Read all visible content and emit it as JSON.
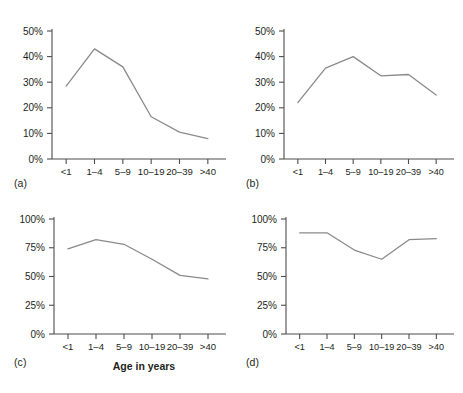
{
  "figure": {
    "panels": [
      {
        "id": "a",
        "label": "(a)",
        "y_ticks": [
          "0%",
          "10%",
          "20%",
          "30%",
          "40%",
          "50%"
        ],
        "x_ticks": [
          "<1",
          "1–4",
          "5–9",
          "10–19",
          "20–39",
          ">40"
        ],
        "line_color": "#8a8a8a"
      },
      {
        "id": "b",
        "label": "(b)",
        "y_ticks": [
          "0%",
          "10%",
          "20%",
          "30%",
          "40%",
          "50%"
        ],
        "x_ticks": [
          "<1",
          "1–4",
          "5–9",
          "10–19",
          "20–39",
          ">40"
        ],
        "line_color": "#8a8a8a"
      },
      {
        "id": "c",
        "label": "(c)",
        "y_ticks": [
          "0%",
          "25%",
          "50%",
          "75%",
          "100%"
        ],
        "x_ticks": [
          "<1",
          "1–4",
          "5–9",
          "10–19",
          "20–39",
          ">40"
        ],
        "axis_title": "Age in years",
        "line_color": "#8a8a8a"
      },
      {
        "id": "d",
        "label": "(d)",
        "y_ticks": [
          "0%",
          "25%",
          "50%",
          "75%",
          "100%"
        ],
        "x_ticks": [
          "<1",
          "1–4",
          "5–9",
          "10–19",
          "20–39",
          ">40"
        ],
        "line_color": "#8a8a8a"
      }
    ]
  },
  "chart_data": [
    {
      "type": "line",
      "panel": "a",
      "title": "(a)",
      "xlabel": "",
      "ylabel": "",
      "categories": [
        "<1",
        "1–4",
        "5–9",
        "10–19",
        "20–39",
        ">40"
      ],
      "values": [
        28.5,
        43.0,
        36.0,
        16.5,
        10.5,
        8.0
      ],
      "ylim": [
        0,
        50
      ],
      "ytick_values": [
        0,
        10,
        20,
        30,
        40,
        50
      ],
      "ytick_labels": [
        "0%",
        "10%",
        "20%",
        "30%",
        "40%",
        "50%"
      ],
      "grid": false,
      "legend": "none",
      "line_color": "#8a8a8a"
    },
    {
      "type": "line",
      "panel": "b",
      "title": "(b)",
      "xlabel": "",
      "ylabel": "",
      "categories": [
        "<1",
        "1–4",
        "5–9",
        "10–19",
        "20–39",
        ">40"
      ],
      "values": [
        22.0,
        35.5,
        40.0,
        32.5,
        33.0,
        25.0
      ],
      "ylim": [
        0,
        50
      ],
      "ytick_values": [
        0,
        10,
        20,
        30,
        40,
        50
      ],
      "ytick_labels": [
        "0%",
        "10%",
        "20%",
        "30%",
        "40%",
        "50%"
      ],
      "grid": false,
      "legend": "none",
      "line_color": "#8a8a8a"
    },
    {
      "type": "line",
      "panel": "c",
      "title": "(c)",
      "xlabel": "Age in years",
      "ylabel": "",
      "categories": [
        "<1",
        "1–4",
        "5–9",
        "10–19",
        "20–39",
        ">40"
      ],
      "values": [
        74.0,
        82.0,
        78.0,
        65.0,
        51.0,
        48.0
      ],
      "ylim": [
        0,
        100
      ],
      "ytick_values": [
        0,
        25,
        50,
        75,
        100
      ],
      "ytick_labels": [
        "0%",
        "25%",
        "50%",
        "75%",
        "100%"
      ],
      "grid": false,
      "legend": "none",
      "line_color": "#8a8a8a"
    },
    {
      "type": "line",
      "panel": "d",
      "title": "(d)",
      "xlabel": "",
      "ylabel": "",
      "categories": [
        "<1",
        "1–4",
        "5–9",
        "10–19",
        "20–39",
        ">40"
      ],
      "values": [
        88.0,
        88.0,
        73.0,
        65.0,
        82.0,
        83.0
      ],
      "ylim": [
        0,
        100
      ],
      "ytick_values": [
        0,
        25,
        50,
        75,
        100
      ],
      "ytick_labels": [
        "0%",
        "25%",
        "50%",
        "75%",
        "100%"
      ],
      "grid": false,
      "legend": "none",
      "line_color": "#8a8a8a"
    }
  ]
}
